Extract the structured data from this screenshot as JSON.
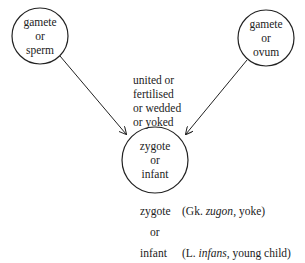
{
  "diagram": {
    "nodes": [
      {
        "id": "sperm",
        "lines": [
          "gamete",
          "or",
          "sperm"
        ]
      },
      {
        "id": "ovum",
        "lines": [
          "gamete",
          "or",
          "ovum"
        ]
      },
      {
        "id": "zygote",
        "lines": [
          "zygote",
          "or",
          "infant"
        ]
      }
    ],
    "edge_label": [
      "united or",
      "fertilised",
      "or wedded",
      "or yoked"
    ],
    "etymology": {
      "word1": "zygote",
      "word1_open": "(Gk. ",
      "word1_italic": "zugon",
      "word1_rest": ", yoke)",
      "connector": "or",
      "word2": "infant",
      "word2_open": "(L. ",
      "word2_italic": "infans",
      "word2_rest": ", young child)"
    },
    "stroke_color": "#222222"
  }
}
